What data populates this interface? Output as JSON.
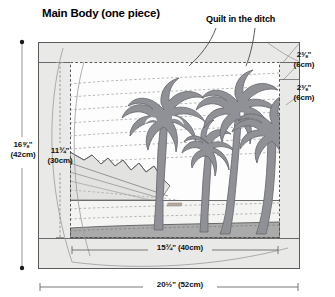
{
  "page": {
    "title": "Main Body (one piece)",
    "annotation": "Quilt in the ditch"
  },
  "dimensions": {
    "outer_height": "16⅝\" (42cm)",
    "outer_height_line1": "16⅝\"",
    "outer_height_line2": "(42cm)",
    "inner_height": "11¾\" (30cm)",
    "inner_height_line1": "11¾\"",
    "inner_height_line2": "(30cm)",
    "inner_width": "15¾\" (40cm)",
    "outer_width": "20½\" (52cm)",
    "border_top": "2⅜\" (6cm)",
    "border_top_line1": "2⅜\"",
    "border_top_line2": "(6cm)",
    "border_right": "2⅜\" (6cm)",
    "border_right_line1": "2⅜\"",
    "border_right_line2": "(6cm)"
  },
  "colors": {
    "fabric_border": "#e8e8e6",
    "outline": "#4a4a4a",
    "palm": "#8f9196",
    "palm_outline": "#6f7176",
    "sky": "#fefefe",
    "beach": "#f2f2f0",
    "foreground": "#a8a8a8",
    "mountain": "#dcdcda",
    "quilt_line": "#9a9a9a",
    "text": "#111111"
  },
  "scene": {
    "name": "tropical-beach-palms",
    "elements": [
      "sky",
      "quilting-lines",
      "mountains",
      "palm-tree-1",
      "palm-tree-2",
      "palm-tree-3",
      "palm-tree-4",
      "beach-band",
      "foreground-band"
    ],
    "palm_tree_count": 4
  }
}
